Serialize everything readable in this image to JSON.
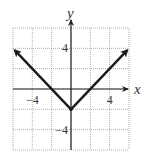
{
  "chart_data": {
    "type": "line",
    "title": "",
    "function": "y = |x| - 2",
    "xlabel": "x",
    "ylabel": "y",
    "xlim": [
      -6,
      6
    ],
    "ylim": [
      -6,
      6
    ],
    "grid": true,
    "grid_step": 2,
    "x_tick_labels": [
      {
        "value": -4,
        "label": "−4"
      },
      {
        "value": 4,
        "label": "4"
      }
    ],
    "y_tick_labels": [
      {
        "value": 4,
        "label": "4"
      },
      {
        "value": -4,
        "label": "−4"
      }
    ],
    "series": [
      {
        "name": "y = |x| - 2",
        "points": [
          [
            -5.8,
            3.8
          ],
          [
            0,
            -2
          ],
          [
            5.8,
            3.8
          ]
        ],
        "arrows": "both-ends",
        "vertex": [
          0,
          -2
        ]
      }
    ]
  },
  "colors": {
    "curve": "#1a1a1a",
    "axis": "#222222",
    "grid": "#9a9a9a"
  }
}
